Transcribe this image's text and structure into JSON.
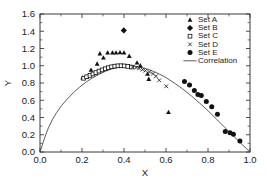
{
  "chart_data": {
    "type": "scatter",
    "title": "",
    "xlabel": "X",
    "ylabel": "Y",
    "xlim": [
      0.0,
      1.0
    ],
    "ylim": [
      0.0,
      1.6
    ],
    "xticks": [
      "0.0",
      "0.2",
      "0.4",
      "0.6",
      "0.8",
      "1.0"
    ],
    "yticks": [
      "0.0",
      "0.2",
      "0.4",
      "0.6",
      "0.8",
      "1.0",
      "1.2",
      "1.4",
      "1.6"
    ],
    "xtick_values": [
      0.0,
      0.2,
      0.4,
      0.6,
      0.8,
      1.0
    ],
    "ytick_values": [
      0.0,
      0.2,
      0.4,
      0.6,
      0.8,
      1.0,
      1.2,
      1.4,
      1.6
    ],
    "grid": false,
    "legend_position": "top-right",
    "legend": [
      "Set A",
      "Set B",
      "Set C",
      "Set D",
      "Set E",
      "Correlation"
    ],
    "series": [
      {
        "name": "Set A",
        "marker": "filled-triangle",
        "color": "#111111",
        "points": [
          [
            0.203,
            0.862
          ],
          [
            0.222,
            0.872
          ],
          [
            0.243,
            0.952
          ],
          [
            0.272,
            1.022
          ],
          [
            0.285,
            1.141
          ],
          [
            0.302,
            1.094
          ],
          [
            0.322,
            1.152
          ],
          [
            0.345,
            1.152
          ],
          [
            0.362,
            1.152
          ],
          [
            0.381,
            1.155
          ],
          [
            0.4,
            1.151
          ],
          [
            0.425,
            1.113
          ],
          [
            0.462,
            1.035
          ],
          [
            0.478,
            1.002
          ],
          [
            0.512,
            0.905
          ],
          [
            0.518,
            0.845
          ],
          [
            0.612,
            0.462
          ]
        ]
      },
      {
        "name": "Set B",
        "marker": "filled-diamond",
        "color": "#111111",
        "points": [
          [
            0.399,
            1.409
          ]
        ]
      },
      {
        "name": "Set C",
        "marker": "open-square",
        "color": "#111111",
        "points": [
          [
            0.208,
            0.855
          ],
          [
            0.222,
            0.872
          ],
          [
            0.238,
            0.888
          ],
          [
            0.252,
            0.905
          ],
          [
            0.266,
            0.921
          ],
          [
            0.281,
            0.938
          ],
          [
            0.296,
            0.952
          ],
          [
            0.311,
            0.965
          ],
          [
            0.326,
            0.978
          ],
          [
            0.341,
            0.988
          ],
          [
            0.356,
            0.995
          ],
          [
            0.371,
            0.999
          ],
          [
            0.386,
            1.0
          ],
          [
            0.401,
            0.998
          ],
          [
            0.418,
            0.993
          ],
          [
            0.435,
            0.985
          ]
        ]
      },
      {
        "name": "Set D",
        "marker": "cross",
        "color": "#111111",
        "points": [
          [
            0.441,
            0.985
          ],
          [
            0.458,
            0.978
          ],
          [
            0.472,
            0.968
          ],
          [
            0.488,
            0.955
          ],
          [
            0.502,
            0.943
          ],
          [
            0.521,
            0.928
          ],
          [
            0.538,
            0.908
          ],
          [
            0.552,
            0.878
          ],
          [
            0.568,
            0.832
          ],
          [
            0.601,
            0.762
          ]
        ]
      },
      {
        "name": "Set E",
        "marker": "filled-circle",
        "color": "#111111",
        "points": [
          [
            0.688,
            0.818
          ],
          [
            0.712,
            0.778
          ],
          [
            0.735,
            0.712
          ],
          [
            0.752,
            0.668
          ],
          [
            0.768,
            0.655
          ],
          [
            0.792,
            0.585
          ],
          [
            0.818,
            0.525
          ],
          [
            0.845,
            0.438
          ],
          [
            0.882,
            0.238
          ],
          [
            0.905,
            0.222
          ],
          [
            0.921,
            0.205
          ],
          [
            0.952,
            0.128
          ]
        ]
      },
      {
        "name": "Correlation",
        "marker": "line",
        "color": "#4a4a4a",
        "description": "Smooth single-peaked curve from (0,0) rising to a maximum of about 1.00 near x=0.38, then falling back to 0 at x=1.0",
        "points": [
          [
            0.0,
            0.0
          ],
          [
            0.02,
            0.15
          ],
          [
            0.04,
            0.28
          ],
          [
            0.06,
            0.38
          ],
          [
            0.08,
            0.46
          ],
          [
            0.1,
            0.53
          ],
          [
            0.13,
            0.615
          ],
          [
            0.16,
            0.69
          ],
          [
            0.19,
            0.755
          ],
          [
            0.22,
            0.812
          ],
          [
            0.25,
            0.86
          ],
          [
            0.28,
            0.9
          ],
          [
            0.31,
            0.935
          ],
          [
            0.34,
            0.962
          ],
          [
            0.37,
            0.982
          ],
          [
            0.395,
            0.995
          ],
          [
            0.42,
            1.0
          ],
          [
            0.45,
            0.995
          ],
          [
            0.48,
            0.982
          ],
          [
            0.51,
            0.962
          ],
          [
            0.54,
            0.935
          ],
          [
            0.57,
            0.902
          ],
          [
            0.6,
            0.862
          ],
          [
            0.64,
            0.8
          ],
          [
            0.68,
            0.73
          ],
          [
            0.72,
            0.652
          ],
          [
            0.76,
            0.568
          ],
          [
            0.8,
            0.478
          ],
          [
            0.84,
            0.382
          ],
          [
            0.88,
            0.285
          ],
          [
            0.92,
            0.188
          ],
          [
            0.96,
            0.092
          ],
          [
            1.0,
            0.0
          ]
        ]
      }
    ]
  }
}
